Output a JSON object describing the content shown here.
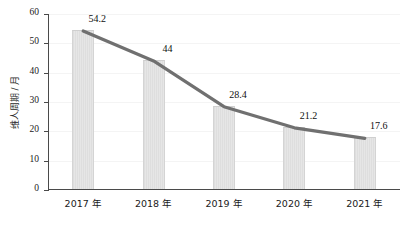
{
  "chart_data": {
    "type": "bar",
    "title": "",
    "xlabel": "",
    "ylabel": "维人周期 / 月",
    "categories": [
      "2017 年",
      "2018 年",
      "2019 年",
      "2020 年",
      "2021 年"
    ],
    "values": [
      54.2,
      44,
      28.4,
      21.2,
      17.6
    ],
    "data_labels": [
      "54.2",
      "44",
      "28.4",
      "21.2",
      "17.6"
    ],
    "ylim": [
      0,
      60
    ],
    "yticks": [
      0,
      10,
      20,
      30,
      40,
      50,
      60
    ],
    "ytick_labels": [
      "0",
      "10",
      "20",
      "30",
      "40",
      "50",
      "60"
    ],
    "grid": true,
    "legend": "none",
    "series": [
      {
        "name": "bar-series",
        "type": "bar",
        "values": [
          54.2,
          44,
          28.4,
          21.2,
          17.6
        ]
      },
      {
        "name": "trend-line",
        "type": "line",
        "values": [
          54.2,
          44,
          28.4,
          21.2,
          17.6
        ]
      }
    ],
    "colors": {
      "bar_fill": "#e0e0e0",
      "bar_edge": "#d0d0d0",
      "line": "#707070",
      "axis": "#4a4a4a",
      "grid": "#f4f4f4",
      "text": "#101010"
    }
  }
}
